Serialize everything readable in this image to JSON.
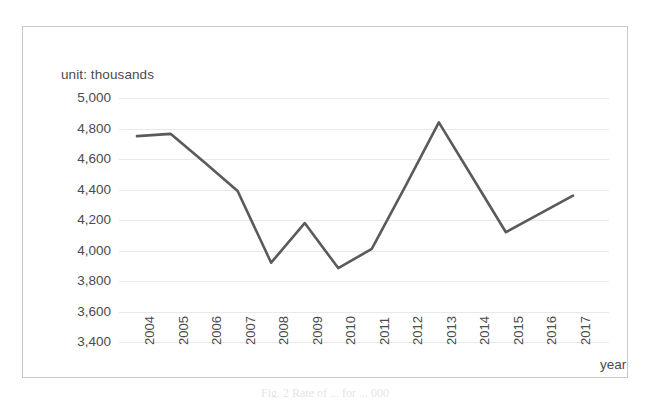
{
  "figure": {
    "unit_label": "unit: thousands",
    "caption": "Fig. 2   Rate of ... for ... 000",
    "line_color": "#5a5a5a",
    "grid_color": "#e9e9e9",
    "frame_color": "#c9c9c9",
    "text_color": "#4b4b4b"
  },
  "chart_data": {
    "type": "line",
    "title": "",
    "subtitle": "",
    "xlabel": "year",
    "ylabel": "unit: thousands",
    "categories": [
      "2004",
      "2005",
      "2006",
      "2007",
      "2008",
      "2009",
      "2010",
      "2011",
      "2012",
      "2013",
      "2014",
      "2015",
      "2016",
      "2017"
    ],
    "values": [
      4750,
      4765,
      4580,
      4390,
      3920,
      4180,
      3885,
      4010,
      4420,
      4840,
      4480,
      4120,
      4240,
      4360
    ],
    "series": [
      {
        "name": "series-1",
        "values": [
          4750,
          4765,
          4580,
          4390,
          3920,
          4180,
          3885,
          4010,
          4420,
          4840,
          4480,
          4120,
          4240,
          4360
        ]
      }
    ],
    "ylim": [
      3400,
      5000
    ],
    "ytick_step": 200,
    "yticks": [
      5000,
      4800,
      4600,
      4400,
      4200,
      4000,
      3800,
      3600,
      3400
    ],
    "ytick_labels": [
      "5,000",
      "4,800",
      "4,600",
      "4,400",
      "4,200",
      "4,000",
      "3,800",
      "3,600",
      "3,400"
    ],
    "xtick_labels": [
      "2004",
      "2005",
      "2006",
      "2007",
      "2008",
      "2009",
      "2010",
      "2011",
      "2012",
      "2013",
      "2014",
      "2015",
      "2016",
      "2017"
    ],
    "xtick_rotation_deg": 90,
    "grid": "horizontal",
    "legend": "none",
    "markers": "none"
  }
}
